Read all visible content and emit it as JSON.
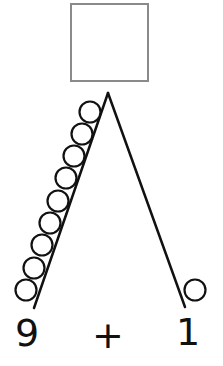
{
  "answer_box": {
    "value": ""
  },
  "bond": {
    "left": {
      "label": "9",
      "counters": 9
    },
    "operator": "+",
    "right": {
      "label": "1",
      "counters": 1
    }
  },
  "colors": {
    "box_border": "#8a8a8a",
    "lines": "#111111",
    "counters": "#111111"
  }
}
